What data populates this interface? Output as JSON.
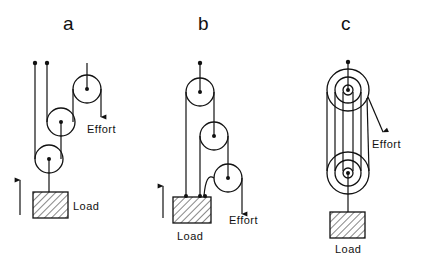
{
  "figure": {
    "panels": [
      {
        "id": "a",
        "label": "a",
        "effort_label": "Effort",
        "load_label": "Load",
        "pulley_count": 3
      },
      {
        "id": "b",
        "label": "b",
        "effort_label": "Effort",
        "load_label": "Load",
        "pulley_count": 3
      },
      {
        "id": "c",
        "label": "c",
        "effort_label": "Effort",
        "load_label": "Load",
        "pulley_count": 2
      }
    ]
  },
  "colors": {
    "ink": "#111111",
    "background": "#ffffff"
  }
}
